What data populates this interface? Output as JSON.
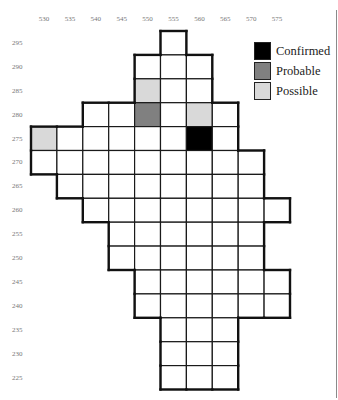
{
  "chart_data": {
    "type": "heatmap",
    "title": "",
    "xlabel": "",
    "ylabel": "",
    "grid": true,
    "legend_position": "top-right",
    "x_ticks": [
      530,
      535,
      540,
      545,
      550,
      555,
      560,
      565,
      570,
      575
    ],
    "y_ticks": [
      295,
      290,
      285,
      280,
      275,
      270,
      265,
      260,
      255,
      250,
      245,
      240,
      235,
      230,
      225
    ],
    "rows": [
      {
        "y": 295,
        "x_from": 555,
        "x_to": 555
      },
      {
        "y": 290,
        "x_from": 550,
        "x_to": 560
      },
      {
        "y": 285,
        "x_from": 550,
        "x_to": 560
      },
      {
        "y": 280,
        "x_from": 540,
        "x_to": 565
      },
      {
        "y": 275,
        "x_from": 530,
        "x_to": 565
      },
      {
        "y": 270,
        "x_from": 530,
        "x_to": 570
      },
      {
        "y": 265,
        "x_from": 535,
        "x_to": 570
      },
      {
        "y": 260,
        "x_from": 540,
        "x_to": 575
      },
      {
        "y": 255,
        "x_from": 545,
        "x_to": 570
      },
      {
        "y": 250,
        "x_from": 545,
        "x_to": 570
      },
      {
        "y": 245,
        "x_from": 550,
        "x_to": 575
      },
      {
        "y": 240,
        "x_from": 550,
        "x_to": 575
      },
      {
        "y": 235,
        "x_from": 555,
        "x_to": 565
      },
      {
        "y": 230,
        "x_from": 555,
        "x_to": 565
      },
      {
        "y": 225,
        "x_from": 555,
        "x_to": 565
      }
    ],
    "highlighted_cells": [
      {
        "x": 550,
        "y": 285,
        "status": "Possible"
      },
      {
        "x": 550,
        "y": 280,
        "status": "Probable"
      },
      {
        "x": 560,
        "y": 280,
        "status": "Possible"
      },
      {
        "x": 530,
        "y": 275,
        "status": "Possible"
      },
      {
        "x": 560,
        "y": 275,
        "status": "Confirmed"
      }
    ],
    "legend": [
      {
        "label": "Confirmed",
        "color": "#000000"
      },
      {
        "label": "Probable",
        "color": "#808080"
      },
      {
        "label": "Possible",
        "color": "#d9d9d9"
      }
    ]
  },
  "colors": {
    "empty_cell": "#ffffff",
    "inner_grid_line": "#1a1a1a",
    "outer_border": "#111111",
    "tick_text": "#777777",
    "frame_line": "#8a8a8a"
  },
  "legend": {
    "items": [
      {
        "label": "Confirmed"
      },
      {
        "label": "Probable"
      },
      {
        "label": "Possible"
      }
    ]
  }
}
